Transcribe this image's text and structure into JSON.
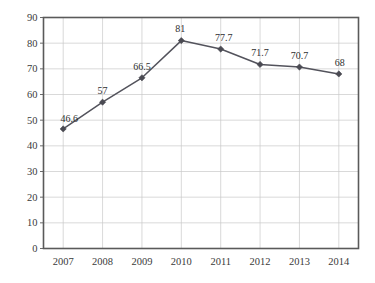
{
  "chart_data": {
    "type": "line",
    "title": "",
    "subtitle": "",
    "xlabel": "",
    "ylabel": "",
    "categories": [
      "2007",
      "2008",
      "2009",
      "2010",
      "2011",
      "2012",
      "2013",
      "2014"
    ],
    "values": [
      46.6,
      57,
      66.5,
      81,
      77.7,
      71.7,
      70.7,
      68
    ],
    "point_labels": [
      "46.6",
      "57",
      "66.5",
      "81",
      "77.7",
      "71.7",
      "70.7",
      "68"
    ],
    "series": [
      {
        "name": "",
        "values": [
          46.6,
          57,
          66.5,
          81,
          77.7,
          71.7,
          70.7,
          68
        ]
      }
    ],
    "ylim": [
      0,
      90
    ],
    "ytick_step": 10,
    "ytick_labels": [
      "0",
      "10",
      "20",
      "30",
      "40",
      "50",
      "60",
      "70",
      "80",
      "90"
    ],
    "ytick_values": [
      0,
      10,
      20,
      30,
      40,
      50,
      60,
      70,
      80,
      90
    ],
    "xtick_labels": [
      "2007",
      "2008",
      "2009",
      "2010",
      "2011",
      "2012",
      "2013",
      "2014"
    ],
    "grid": {
      "horizontal": true,
      "vertical": true,
      "color": "#c9c9c9"
    },
    "legend": {
      "visible": false,
      "position": "none",
      "entries": []
    },
    "marker": {
      "shape": "diamond",
      "color": "#4a4a52"
    },
    "line_color": "#53535c",
    "frame_color": "#5a5a5a",
    "background_color": "#ffffff",
    "data_label_color": "#2e2e2e"
  }
}
